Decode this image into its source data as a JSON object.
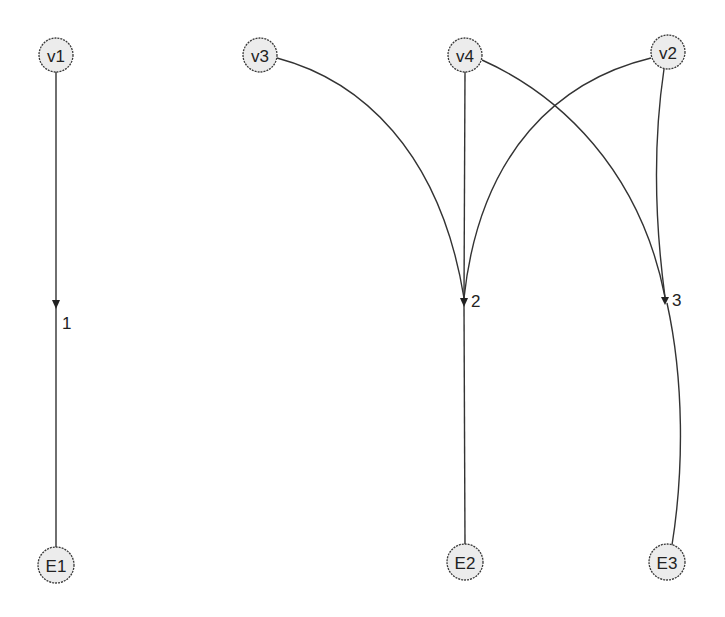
{
  "diagram": {
    "type": "bipartite-directed-graph",
    "colors": {
      "node_fill": "#ececec",
      "node_stroke": "#3a3a3a",
      "edge": "#333333",
      "text": "#222222"
    },
    "top_nodes": [
      {
        "id": "v1",
        "label": "v1",
        "x": 56,
        "y": 55
      },
      {
        "id": "v3",
        "label": "v3",
        "x": 260,
        "y": 55
      },
      {
        "id": "v4",
        "label": "v4",
        "x": 465,
        "y": 55
      },
      {
        "id": "v2",
        "label": "v2",
        "x": 668,
        "y": 52
      }
    ],
    "junctions": [
      {
        "id": "j1",
        "label": "1",
        "x": 56,
        "y": 305
      },
      {
        "id": "j2",
        "label": "2",
        "x": 464,
        "y": 301
      },
      {
        "id": "j3",
        "label": "3",
        "x": 666,
        "y": 300
      }
    ],
    "bottom_nodes": [
      {
        "id": "E1",
        "label": "E1",
        "x": 56,
        "y": 565
      },
      {
        "id": "E2",
        "label": "E2",
        "x": 465,
        "y": 562
      },
      {
        "id": "E3",
        "label": "E3",
        "x": 667,
        "y": 562
      }
    ],
    "edges": [
      {
        "from": "v1",
        "to": "1"
      },
      {
        "from": "v3",
        "to": "2"
      },
      {
        "from": "v4",
        "to": "2"
      },
      {
        "from": "v2",
        "to": "2"
      },
      {
        "from": "v4",
        "to": "3"
      },
      {
        "from": "v2",
        "to": "3"
      },
      {
        "from": "1",
        "to": "E1"
      },
      {
        "from": "2",
        "to": "E2"
      },
      {
        "from": "3",
        "to": "E3"
      }
    ]
  }
}
